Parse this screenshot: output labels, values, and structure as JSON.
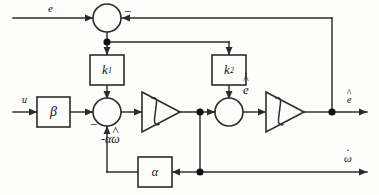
{
  "diagram": {
    "type": "control-block-diagram",
    "background_color": "#fdfdfb",
    "line_color": "#2b2b2b",
    "text_color": "#151515"
  },
  "signals": {
    "input_error": "e",
    "input_u": "u",
    "feedback_term": "-αω",
    "feedback_term_parts": {
      "sign": "-",
      "gain": "α",
      "variable": "ω",
      "accent": "hat"
    },
    "edot_hat": "e",
    "edot_hat_parts": {
      "variable": "e",
      "accents": [
        "hat",
        "dot"
      ]
    },
    "output_ehat": "e",
    "output_ehat_parts": {
      "variable": "e",
      "accent": "hat"
    },
    "output_omegadot": "ω",
    "output_omegadot_parts": {
      "variable": "ω",
      "accent": "dot"
    }
  },
  "blocks": [
    {
      "id": "k1",
      "label": "k",
      "subscript": "1",
      "shape": "rect",
      "name": "gain-block-k1"
    },
    {
      "id": "k2",
      "label": "k",
      "subscript": "2",
      "shape": "rect",
      "name": "gain-block-k2"
    },
    {
      "id": "beta",
      "label": "β",
      "subscript": "",
      "shape": "rect",
      "name": "gain-block-beta"
    },
    {
      "id": "alpha",
      "label": "α",
      "subscript": "",
      "shape": "rect",
      "name": "gain-block-alpha"
    }
  ],
  "integrators": [
    {
      "id": "int1",
      "label": "∫",
      "shape": "triangle",
      "name": "integrator-block-1"
    },
    {
      "id": "int2",
      "label": "∫",
      "shape": "triangle",
      "name": "integrator-block-2"
    }
  ],
  "summing_junctions": [
    {
      "id": "sum-top",
      "name": "summing-junction-top",
      "signs": [
        "+",
        "-"
      ]
    },
    {
      "id": "sum-main",
      "name": "summing-junction-main",
      "signs": [
        "+",
        "+",
        "-"
      ]
    },
    {
      "id": "sum-right",
      "name": "summing-junction-right",
      "signs": [
        "+",
        "+"
      ]
    }
  ],
  "signs": {
    "top_minus": "−",
    "main_minus": "−"
  }
}
